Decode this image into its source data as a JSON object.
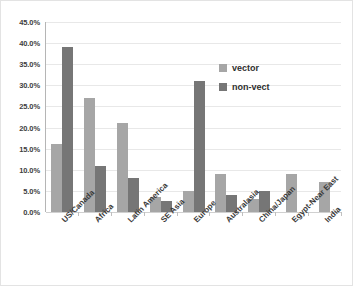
{
  "chart_data": {
    "type": "bar",
    "title": "",
    "subtitle": "",
    "xlabel": "",
    "ylabel": "",
    "ylim": [
      0,
      45
    ],
    "ytick_labels": [
      "45.0%",
      "40.0%",
      "35.0%",
      "30.0%",
      "25.0%",
      "20.0%",
      "15.0%",
      "10.0%",
      "5.0%",
      "0.0%"
    ],
    "ytick_values": [
      45,
      40,
      35,
      30,
      25,
      20,
      15,
      10,
      5,
      0
    ],
    "grid": true,
    "legend_position": "inside-upper-right",
    "categories": [
      "US/Canada",
      "Africa",
      "Latin America",
      "SE Asia",
      "Europe",
      "Australasia",
      "China/Japan",
      "Egypt-Near East",
      "India"
    ],
    "series": [
      {
        "name": "vector",
        "color": "#a6a6a6",
        "values": [
          16.0,
          27.0,
          21.0,
          3.5,
          5.0,
          9.0,
          3.0,
          9.0,
          7.0
        ]
      },
      {
        "name": "non-vect",
        "color": "#767676",
        "values": [
          39.0,
          11.0,
          8.0,
          2.5,
          31.0,
          4.0,
          5.0,
          0,
          0
        ]
      }
    ]
  },
  "legend": {
    "items": [
      {
        "label": "vector",
        "color": "#a6a6a6"
      },
      {
        "label": "non-vect",
        "color": "#767676"
      }
    ]
  },
  "colors": {
    "vector": "#a6a6a6",
    "non_vect": "#767676",
    "grid": "#e8e8e8",
    "axis": "#b5b5b5",
    "background": "#ffffff",
    "text": "#3a3a3a"
  }
}
